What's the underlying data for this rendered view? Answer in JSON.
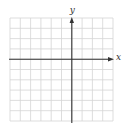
{
  "diagram": {
    "type": "coordinate-grid",
    "x_axis_label": "x",
    "y_axis_label": "y",
    "grid": {
      "columns": 10,
      "rows": 10,
      "left": 10,
      "top": 18,
      "cell_size": 10.3,
      "origin_col": 6,
      "origin_row": 4,
      "grid_color": "#d4d4d4",
      "axis_color": "#333333"
    }
  }
}
